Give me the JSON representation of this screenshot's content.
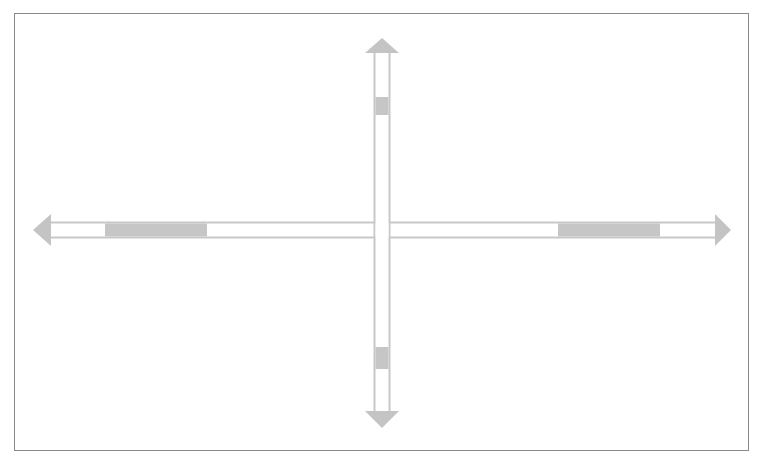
{
  "diagram": {
    "type": "cross-arrows",
    "colors": {
      "frame_border": "#8a8a8a",
      "arrow_outline": "#c8c8c8",
      "arrow_fill": "#ffffff",
      "arrowhead_fill": "#c4c4c4",
      "marker_fill": "#c6c6c6",
      "background": "#ffffff"
    },
    "arms": [
      {
        "direction": "up",
        "marker": "shaded-segment"
      },
      {
        "direction": "down",
        "marker": "shaded-segment"
      },
      {
        "direction": "left",
        "marker": "shaded-segment"
      },
      {
        "direction": "right",
        "marker": "shaded-segment"
      }
    ]
  }
}
